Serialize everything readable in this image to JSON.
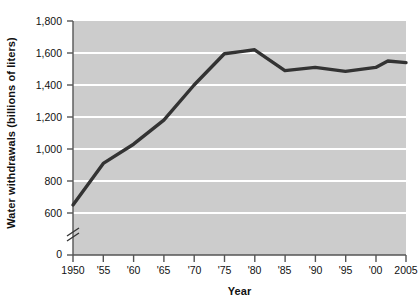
{
  "chart_data": {
    "type": "line",
    "title": "",
    "subtitle": "",
    "xlabel": "Year",
    "ylabel": "Water withdrawals (billions of liters)",
    "x": [
      1950,
      1955,
      1960,
      1965,
      1970,
      1975,
      1978,
      1980,
      1985,
      1990,
      1995,
      2000,
      2002,
      2005
    ],
    "values": [
      650,
      910,
      1030,
      1180,
      1400,
      1595,
      1610,
      1620,
      1490,
      1510,
      1485,
      1510,
      1550,
      1540
    ],
    "series": [
      {
        "name": "Water withdrawals",
        "values": [
          650,
          910,
          1030,
          1180,
          1400,
          1595,
          1610,
          1620,
          1490,
          1510,
          1485,
          1510,
          1550,
          1540
        ]
      }
    ],
    "xlim": [
      1950,
      2005
    ],
    "ylim": [
      0,
      1800
    ],
    "y_axis_break": true,
    "y_axis_break_between": [
      0,
      600
    ],
    "grid": true,
    "grid_orientation": "horizontal",
    "legend": false,
    "legend_position": "none",
    "x_tick_labels": [
      "1950",
      "'55",
      "'60",
      "'65",
      "'70",
      "'75",
      "'80",
      "'85",
      "'90",
      "'95",
      "'00",
      "2005"
    ],
    "x_tick_values": [
      1950,
      1955,
      1960,
      1965,
      1970,
      1975,
      1980,
      1985,
      1990,
      1995,
      2000,
      2005
    ],
    "y_tick_labels": [
      "0",
      "600",
      "800",
      "1,000",
      "1,200",
      "1,400",
      "1,600",
      "1,800"
    ],
    "y_tick_values": [
      0,
      600,
      800,
      1000,
      1200,
      1400,
      1600,
      1800
    ],
    "colors": {
      "plot_background": "#cccccc",
      "gridline": "#ffffff",
      "line": "#333333",
      "axis": "#555555",
      "text": "#111111",
      "page_background": "#ffffff"
    }
  },
  "y_ticks": [
    {
      "label": "1,800"
    },
    {
      "label": "1,600"
    },
    {
      "label": "1,400"
    },
    {
      "label": "1,200"
    },
    {
      "label": "1,000"
    },
    {
      "label": "800"
    },
    {
      "label": "600"
    },
    {
      "label": "0"
    }
  ],
  "x_ticks": [
    {
      "label": "1950"
    },
    {
      "label": "'55"
    },
    {
      "label": "'60"
    },
    {
      "label": "'65"
    },
    {
      "label": "'70"
    },
    {
      "label": "'75"
    },
    {
      "label": "'80"
    },
    {
      "label": "'85"
    },
    {
      "label": "'90"
    },
    {
      "label": "'95"
    },
    {
      "label": "'00"
    },
    {
      "label": "2005"
    }
  ]
}
